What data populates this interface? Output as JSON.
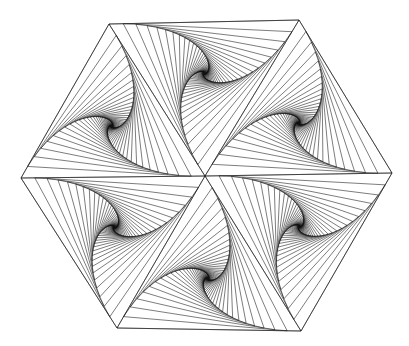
{
  "figure": {
    "width": 409,
    "height": 346,
    "background": "#ffffff",
    "stroke_color": "#111111",
    "stroke_width": 0.55,
    "center": [
      205,
      176
    ],
    "vertices": [
      [
        109,
        24
      ],
      [
        299,
        20
      ],
      [
        392,
        173
      ],
      [
        301,
        331
      ],
      [
        117,
        328
      ],
      [
        21,
        178
      ]
    ],
    "lines_per_fan": 44
  }
}
